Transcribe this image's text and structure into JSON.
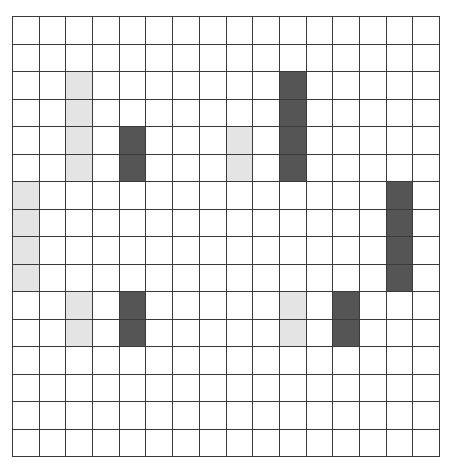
{
  "grid": {
    "columns": 16,
    "rows": 16,
    "colors": {
      "empty": "#ffffff",
      "light": "#e4e4e4",
      "dark": "#555555",
      "line": "#3a3a3a"
    },
    "shaded_cells": [
      {
        "col": 2,
        "row": 2,
        "shade": "light"
      },
      {
        "col": 2,
        "row": 3,
        "shade": "light"
      },
      {
        "col": 2,
        "row": 4,
        "shade": "light"
      },
      {
        "col": 2,
        "row": 5,
        "shade": "light"
      },
      {
        "col": 0,
        "row": 6,
        "shade": "light"
      },
      {
        "col": 0,
        "row": 7,
        "shade": "light"
      },
      {
        "col": 0,
        "row": 8,
        "shade": "light"
      },
      {
        "col": 0,
        "row": 9,
        "shade": "light"
      },
      {
        "col": 2,
        "row": 10,
        "shade": "light"
      },
      {
        "col": 2,
        "row": 11,
        "shade": "light"
      },
      {
        "col": 8,
        "row": 4,
        "shade": "light"
      },
      {
        "col": 8,
        "row": 5,
        "shade": "light"
      },
      {
        "col": 10,
        "row": 10,
        "shade": "light"
      },
      {
        "col": 10,
        "row": 11,
        "shade": "light"
      },
      {
        "col": 4,
        "row": 4,
        "shade": "dark"
      },
      {
        "col": 4,
        "row": 5,
        "shade": "dark"
      },
      {
        "col": 10,
        "row": 2,
        "shade": "dark"
      },
      {
        "col": 10,
        "row": 3,
        "shade": "dark"
      },
      {
        "col": 10,
        "row": 4,
        "shade": "dark"
      },
      {
        "col": 10,
        "row": 5,
        "shade": "dark"
      },
      {
        "col": 14,
        "row": 6,
        "shade": "dark"
      },
      {
        "col": 14,
        "row": 7,
        "shade": "dark"
      },
      {
        "col": 14,
        "row": 8,
        "shade": "dark"
      },
      {
        "col": 14,
        "row": 9,
        "shade": "dark"
      },
      {
        "col": 4,
        "row": 10,
        "shade": "dark"
      },
      {
        "col": 4,
        "row": 11,
        "shade": "dark"
      },
      {
        "col": 12,
        "row": 10,
        "shade": "dark"
      },
      {
        "col": 12,
        "row": 11,
        "shade": "dark"
      }
    ]
  }
}
